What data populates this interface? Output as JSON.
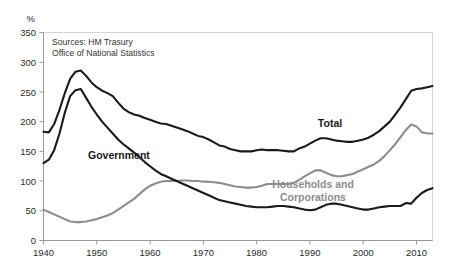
{
  "chart_data": {
    "type": "line",
    "title": "",
    "xlabel": "",
    "ylabel": "%",
    "ylim": [
      0,
      350
    ],
    "xlim": [
      1940,
      2013
    ],
    "ytick_step": 50,
    "yticks": [
      "0",
      "50",
      "100",
      "150",
      "200",
      "250",
      "300",
      "350"
    ],
    "xticks": [
      "1940",
      "1950",
      "1960",
      "1970",
      "1980",
      "1990",
      "2000",
      "2010"
    ],
    "grid": false,
    "legend_position": "inline-annotations",
    "annotations": [
      {
        "text": "Sources: HM Trasury",
        "role": "source-line-1"
      },
      {
        "text": "Office of National Statistics",
        "role": "source-line-2"
      }
    ],
    "colors": {
      "total": "#1a1a1a",
      "government": "#1a1a1a",
      "households": "#8d8d8d"
    },
    "x": [
      1940,
      1941,
      1942,
      1943,
      1944,
      1945,
      1946,
      1947,
      1948,
      1949,
      1950,
      1951,
      1952,
      1953,
      1954,
      1955,
      1956,
      1957,
      1958,
      1959,
      1960,
      1961,
      1962,
      1963,
      1964,
      1965,
      1966,
      1967,
      1968,
      1969,
      1970,
      1971,
      1972,
      1973,
      1974,
      1975,
      1976,
      1977,
      1978,
      1979,
      1980,
      1981,
      1982,
      1983,
      1984,
      1985,
      1986,
      1987,
      1988,
      1989,
      1990,
      1991,
      1992,
      1993,
      1994,
      1995,
      1996,
      1997,
      1998,
      1999,
      2000,
      2001,
      2002,
      2003,
      2004,
      2005,
      2006,
      2007,
      2008,
      2009,
      2010,
      2011,
      2012,
      2013
    ],
    "series": [
      {
        "name": "Total",
        "color": "#1a1a1a",
        "values": [
          183,
          182,
          196,
          220,
          248,
          272,
          284,
          286,
          277,
          266,
          258,
          252,
          248,
          243,
          232,
          222,
          216,
          212,
          210,
          206,
          203,
          200,
          197,
          196,
          193,
          190,
          187,
          184,
          180,
          176,
          174,
          170,
          165,
          160,
          158,
          154,
          152,
          150,
          150,
          150,
          152,
          153,
          152,
          152,
          152,
          151,
          150,
          150,
          155,
          158,
          163,
          168,
          172,
          172,
          170,
          168,
          167,
          166,
          166,
          168,
          170,
          173,
          178,
          184,
          192,
          200,
          212,
          224,
          238,
          252,
          255,
          256,
          258,
          260
        ]
      },
      {
        "name": "Government",
        "color": "#1a1a1a",
        "values": [
          130,
          136,
          152,
          180,
          215,
          243,
          253,
          255,
          240,
          225,
          212,
          200,
          190,
          180,
          170,
          162,
          155,
          148,
          140,
          132,
          125,
          118,
          112,
          108,
          104,
          100,
          96,
          92,
          88,
          84,
          80,
          76,
          72,
          68,
          66,
          64,
          62,
          60,
          58,
          57,
          56,
          56,
          56,
          57,
          58,
          58,
          57,
          56,
          54,
          52,
          51,
          52,
          56,
          60,
          62,
          62,
          60,
          58,
          56,
          54,
          52,
          52,
          54,
          56,
          57,
          58,
          58,
          58,
          63,
          62,
          72,
          80,
          85,
          88
        ]
      },
      {
        "name": "Households and Corporations",
        "color": "#8d8d8d",
        "values": [
          52,
          48,
          44,
          40,
          36,
          32,
          31,
          31,
          32,
          34,
          36,
          39,
          42,
          46,
          52,
          58,
          64,
          70,
          78,
          86,
          92,
          96,
          99,
          100,
          100,
          100,
          101,
          101,
          100,
          100,
          99,
          99,
          98,
          97,
          95,
          93,
          91,
          90,
          89,
          89,
          90,
          92,
          95,
          95,
          95,
          95,
          95,
          97,
          102,
          108,
          113,
          118,
          118,
          114,
          110,
          108,
          108,
          110,
          112,
          116,
          120,
          124,
          128,
          134,
          142,
          152,
          162,
          174,
          186,
          195,
          192,
          182,
          180,
          180
        ]
      }
    ]
  },
  "labels": {
    "unit": "%",
    "total": "Total",
    "government": "Government",
    "households_line1": "Households and",
    "households_line2": "Corporations",
    "source_line1": "Sources: HM Trasury",
    "source_line2": "Office of National Statistics"
  }
}
